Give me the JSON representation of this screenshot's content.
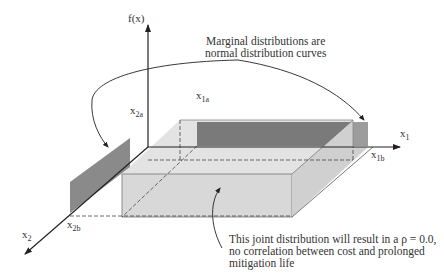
{
  "diagram": {
    "axes": {
      "vertical": {
        "label": "f(x)"
      },
      "x1": {
        "label": "x",
        "sub": "1"
      },
      "x2": {
        "label": "x",
        "sub": "2"
      }
    },
    "bounds": {
      "x1a": {
        "label": "x",
        "sub": "1a"
      },
      "x1b": {
        "label": "x",
        "sub": "1b"
      },
      "x2a": {
        "label": "x",
        "sub": "2a"
      },
      "x2b": {
        "label": "x",
        "sub": "2b"
      }
    },
    "annotations": {
      "marginal": {
        "line1": "Marginal distributions are",
        "line2": "normal distribution curves"
      },
      "joint": {
        "line1": "This joint distribution will result in a ρ = 0.0,",
        "line2": "no correlation between cost and prolonged",
        "line3": "mitigation life"
      }
    },
    "colors": {
      "box_face": "#d9d9d9",
      "box_side": "#cfcfcf",
      "box_top": "#e2e2e2",
      "marginal_dark": "#7a7a7a",
      "marginal_light": "#9a9a9a",
      "line": "#222222"
    }
  }
}
